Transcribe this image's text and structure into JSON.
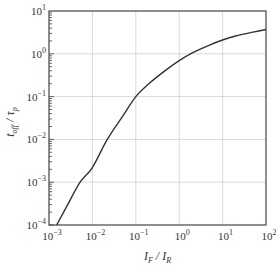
{
  "chart_data": {
    "type": "line",
    "title": "",
    "xlabel": "I_F / I_R",
    "ylabel": "t_off / τ_p",
    "xscale": "log",
    "yscale": "log",
    "xlim": [
      0.001,
      100
    ],
    "ylim": [
      0.0001,
      10
    ],
    "grid": true,
    "legend": null,
    "x_ticks": [
      {
        "base": "10",
        "exp": "−3",
        "value": 0.001
      },
      {
        "base": "10",
        "exp": "−2",
        "value": 0.01
      },
      {
        "base": "10",
        "exp": "−1",
        "value": 0.1
      },
      {
        "base": "10",
        "exp": "0",
        "value": 1
      },
      {
        "base": "10",
        "exp": "1",
        "value": 10
      },
      {
        "base": "10",
        "exp": "2",
        "value": 100
      }
    ],
    "y_ticks": [
      {
        "base": "10",
        "exp": "−4",
        "value": 0.0001
      },
      {
        "base": "10",
        "exp": "−3",
        "value": 0.001
      },
      {
        "base": "10",
        "exp": "−2",
        "value": 0.01
      },
      {
        "base": "10",
        "exp": "−1",
        "value": 0.1
      },
      {
        "base": "10",
        "exp": "0",
        "value": 1
      },
      {
        "base": "10",
        "exp": "1",
        "value": 10
      }
    ],
    "series": [
      {
        "name": "t_off / τ_p",
        "color": "#333333",
        "x": [
          0.0015,
          0.0025,
          0.0052,
          0.01,
          0.022,
          0.05,
          0.1,
          0.2,
          0.5,
          1,
          2,
          5,
          10,
          20,
          50,
          100
        ],
        "y": [
          0.0001,
          0.00026,
          0.001,
          0.0022,
          0.01,
          0.035,
          0.1,
          0.2,
          0.42,
          0.69,
          1.05,
          1.6,
          2.1,
          2.6,
          3.2,
          3.7
        ]
      }
    ]
  },
  "axes": {
    "x_label": {
      "main1": "I",
      "sub1": "F",
      "sep": " / ",
      "main2": "I",
      "sub2": "R"
    },
    "y_label": {
      "main1": "t",
      "sub1": "off",
      "sep": " / ",
      "main2": "τ",
      "sub2": "p"
    }
  },
  "style": {
    "line_color": "#333333",
    "axis_color": "#444444",
    "grid_color": "#cfcfcf",
    "background": "#ffffff"
  }
}
